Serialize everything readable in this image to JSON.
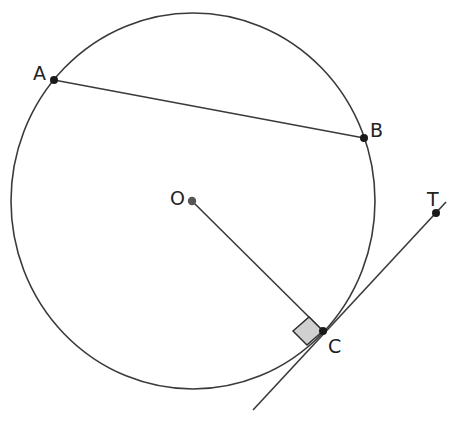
{
  "diagram": {
    "colors": {
      "stroke": "#3a3a3a",
      "point": "#1a1a1a",
      "center_point": "#555555",
      "right_angle_fill": "#d0d0d0",
      "label": "#222222"
    },
    "circle": {
      "cx": 193,
      "cy": 201,
      "rx": 182,
      "ry": 188
    },
    "points": {
      "A": {
        "label": "A",
        "x": 54,
        "y": 80,
        "label_x": 33,
        "label_y": 80
      },
      "B": {
        "label": "B",
        "x": 364,
        "y": 138,
        "label_x": 370,
        "label_y": 137
      },
      "O": {
        "label": "O",
        "x": 192,
        "y": 201,
        "label_x": 170,
        "label_y": 205
      },
      "C": {
        "label": "C",
        "x": 323,
        "y": 331,
        "label_x": 328,
        "label_y": 353
      },
      "T": {
        "label": "T",
        "x": 436,
        "y": 213,
        "label_x": 427,
        "label_y": 206
      }
    },
    "segments": [
      {
        "name": "chord-AB",
        "from": "A",
        "to": "B"
      },
      {
        "name": "radius-OC",
        "from": "O",
        "to": "C"
      }
    ],
    "tangent_line": {
      "x1": 446,
      "y1": 202,
      "x2": 253,
      "y2": 410
    },
    "right_angle_marker": {
      "points": "323,331 309,317 293,331 307,345"
    }
  }
}
